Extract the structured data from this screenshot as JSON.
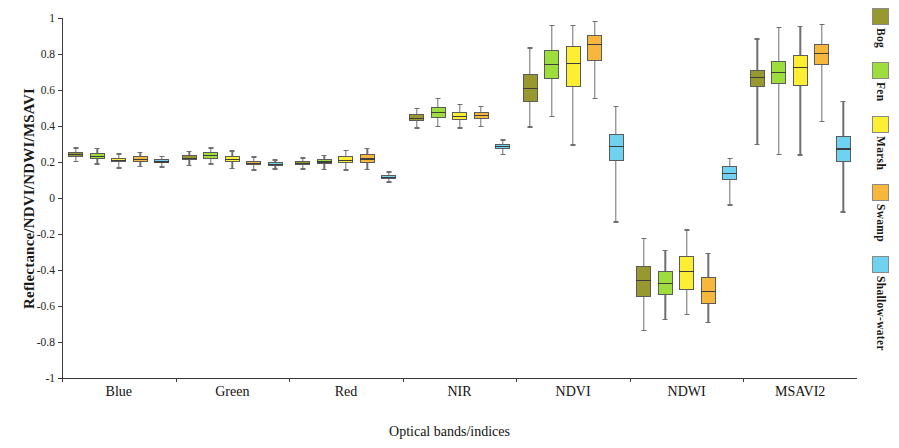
{
  "chart_data": {
    "type": "box",
    "title": "",
    "xlabel": "Optical bands/indices",
    "ylabel": "Reflectance/NDVI/NDWI/MSAVI",
    "ylim": [
      -1,
      1
    ],
    "ytick_labels": [
      "1",
      "0.8",
      "0.6",
      "0.4",
      "0.2",
      "0",
      "-0.2",
      "-0.4",
      "-0.6",
      "-0.8",
      "-1"
    ],
    "ytick_values": [
      1,
      0.8,
      0.6,
      0.4,
      0.2,
      0,
      -0.2,
      -0.4,
      -0.6,
      -0.8,
      -1
    ],
    "categories": [
      "Blue",
      "Green",
      "Red",
      "NIR",
      "NDVI",
      "NDWI",
      "MSAVI2"
    ],
    "grid": false,
    "legend_position": "right-outside",
    "legend": [
      {
        "name": "Bog",
        "color": "#97992e"
      },
      {
        "name": "Fen",
        "color": "#9ede3c"
      },
      {
        "name": "Marsh",
        "color": "#fcee33"
      },
      {
        "name": "Swamp",
        "color": "#f6b73c"
      },
      {
        "name": "Shallow-water",
        "color": "#6fd2f0"
      }
    ],
    "series": [
      {
        "name": "Bog",
        "color": "#97992e",
        "boxes": [
          {
            "category": "Blue",
            "whisker_low": 0.205,
            "q1": 0.23,
            "median": 0.247,
            "q3": 0.258,
            "whisker_high": 0.281
          },
          {
            "category": "Green",
            "whisker_low": 0.185,
            "q1": 0.21,
            "median": 0.224,
            "q3": 0.238,
            "whisker_high": 0.262
          },
          {
            "category": "Red",
            "whisker_low": 0.166,
            "q1": 0.185,
            "median": 0.196,
            "q3": 0.208,
            "whisker_high": 0.227
          },
          {
            "category": "NIR",
            "whisker_low": 0.392,
            "q1": 0.428,
            "median": 0.447,
            "q3": 0.466,
            "whisker_high": 0.502
          },
          {
            "category": "NDVI",
            "whisker_low": 0.398,
            "q1": 0.532,
            "median": 0.612,
            "q3": 0.688,
            "whisker_high": 0.838
          },
          {
            "category": "NDWI",
            "whisker_low": -0.733,
            "q1": -0.552,
            "median": -0.455,
            "q3": -0.38,
            "whisker_high": -0.222
          },
          {
            "category": "MSAVI2",
            "whisker_low": 0.302,
            "q1": 0.615,
            "median": 0.672,
            "q3": 0.712,
            "whisker_high": 0.888
          }
        ]
      },
      {
        "name": "Fen",
        "color": "#9ede3c",
        "boxes": [
          {
            "category": "Blue",
            "whisker_low": 0.193,
            "q1": 0.218,
            "median": 0.235,
            "q3": 0.25,
            "whisker_high": 0.278
          },
          {
            "category": "Green",
            "whisker_low": 0.192,
            "q1": 0.218,
            "median": 0.238,
            "q3": 0.253,
            "whisker_high": 0.282
          },
          {
            "category": "Red",
            "whisker_low": 0.163,
            "q1": 0.188,
            "median": 0.203,
            "q3": 0.216,
            "whisker_high": 0.24
          },
          {
            "category": "NIR",
            "whisker_low": 0.4,
            "q1": 0.447,
            "median": 0.48,
            "q3": 0.508,
            "whisker_high": 0.557
          },
          {
            "category": "NDVI",
            "whisker_low": 0.455,
            "q1": 0.66,
            "median": 0.745,
            "q3": 0.82,
            "whisker_high": 0.962
          },
          {
            "category": "NDWI",
            "whisker_low": -0.672,
            "q1": -0.54,
            "median": -0.47,
            "q3": -0.403,
            "whisker_high": -0.287
          },
          {
            "category": "MSAVI2",
            "whisker_low": 0.245,
            "q1": 0.632,
            "median": 0.7,
            "q3": 0.762,
            "whisker_high": 0.95
          }
        ]
      },
      {
        "name": "Marsh",
        "color": "#fcee33",
        "boxes": [
          {
            "category": "Blue",
            "whisker_low": 0.17,
            "q1": 0.198,
            "median": 0.211,
            "q3": 0.222,
            "whisker_high": 0.248
          },
          {
            "category": "Green",
            "whisker_low": 0.168,
            "q1": 0.198,
            "median": 0.219,
            "q3": 0.234,
            "whisker_high": 0.264
          },
          {
            "category": "Red",
            "whisker_low": 0.16,
            "q1": 0.194,
            "median": 0.213,
            "q3": 0.233,
            "whisker_high": 0.267
          },
          {
            "category": "NIR",
            "whisker_low": 0.392,
            "q1": 0.432,
            "median": 0.458,
            "q3": 0.48,
            "whisker_high": 0.522
          },
          {
            "category": "NDVI",
            "whisker_low": 0.298,
            "q1": 0.617,
            "median": 0.752,
            "q3": 0.845,
            "whisker_high": 0.962
          },
          {
            "category": "NDWI",
            "whisker_low": -0.645,
            "q1": -0.512,
            "median": -0.406,
            "q3": -0.32,
            "whisker_high": -0.174
          },
          {
            "category": "MSAVI2",
            "whisker_low": 0.242,
            "q1": 0.623,
            "median": 0.73,
            "q3": 0.795,
            "whisker_high": 0.958
          }
        ]
      },
      {
        "name": "Swamp",
        "color": "#f6b73c",
        "boxes": [
          {
            "category": "Blue",
            "whisker_low": 0.178,
            "q1": 0.2,
            "median": 0.217,
            "q3": 0.232,
            "whisker_high": 0.258
          },
          {
            "category": "Green",
            "whisker_low": 0.16,
            "q1": 0.182,
            "median": 0.196,
            "q3": 0.208,
            "whisker_high": 0.232
          },
          {
            "category": "Red",
            "whisker_low": 0.163,
            "q1": 0.196,
            "median": 0.22,
            "q3": 0.242,
            "whisker_high": 0.278
          },
          {
            "category": "NIR",
            "whisker_low": 0.4,
            "q1": 0.44,
            "median": 0.46,
            "q3": 0.477,
            "whisker_high": 0.513
          },
          {
            "category": "NDVI",
            "whisker_low": 0.555,
            "q1": 0.76,
            "median": 0.855,
            "q3": 0.903,
            "whisker_high": 0.985
          },
          {
            "category": "NDWI",
            "whisker_low": -0.687,
            "q1": -0.59,
            "median": -0.515,
            "q3": -0.44,
            "whisker_high": -0.305
          },
          {
            "category": "MSAVI2",
            "whisker_low": 0.43,
            "q1": 0.74,
            "median": 0.805,
            "q3": 0.855,
            "whisker_high": 0.968
          }
        ]
      },
      {
        "name": "Shallow-water",
        "color": "#6fd2f0",
        "boxes": [
          {
            "category": "Blue",
            "whisker_low": 0.176,
            "q1": 0.192,
            "median": 0.203,
            "q3": 0.218,
            "whisker_high": 0.233
          },
          {
            "category": "Green",
            "whisker_low": 0.166,
            "q1": 0.18,
            "median": 0.19,
            "q3": 0.2,
            "whisker_high": 0.216
          },
          {
            "category": "Red",
            "whisker_low": 0.092,
            "q1": 0.105,
            "median": 0.116,
            "q3": 0.128,
            "whisker_high": 0.148
          },
          {
            "category": "NIR",
            "whisker_low": 0.245,
            "q1": 0.272,
            "median": 0.288,
            "q3": 0.3,
            "whisker_high": 0.327
          },
          {
            "category": "NDVI",
            "whisker_low": -0.13,
            "q1": 0.205,
            "median": 0.288,
            "q3": 0.358,
            "whisker_high": 0.513
          },
          {
            "category": "NDWI",
            "whisker_low": -0.035,
            "q1": 0.1,
            "median": 0.14,
            "q3": 0.18,
            "whisker_high": 0.225
          },
          {
            "category": "MSAVI2",
            "whisker_low": -0.073,
            "q1": 0.2,
            "median": 0.276,
            "q3": 0.343,
            "whisker_high": 0.54
          }
        ]
      }
    ]
  }
}
